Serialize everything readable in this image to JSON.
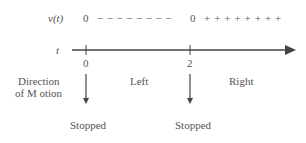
{
  "diagram": {
    "type": "sign-chart",
    "velocity_row": {
      "label": "v(t)",
      "first_zero": "0",
      "negative_signs": "− − − − − − − −",
      "second_zero": "0",
      "positive_signs": "+ + + + + + + +"
    },
    "axis": {
      "label": "t",
      "ticks": [
        {
          "value": "0"
        },
        {
          "value": "2"
        }
      ]
    },
    "motion": {
      "heading_line1": "Direction",
      "heading_line2": "of M otion",
      "intervals": [
        "Left",
        "Right"
      ],
      "critical_points": [
        {
          "at": "0",
          "state": "Stopped"
        },
        {
          "at": "2",
          "state": "Stopped"
        }
      ]
    },
    "colors": {
      "ink": "#555555",
      "line": "#444444"
    }
  }
}
